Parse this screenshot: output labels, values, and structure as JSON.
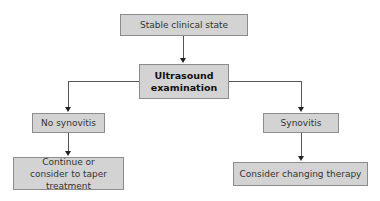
{
  "diagram": {
    "type": "flowchart",
    "nodes": {
      "start": "Stable clinical state",
      "exam": "Ultrasound examination",
      "no_synovitis": "No synovitis",
      "synovitis": "Synovitis",
      "continue": "Continue or consider to taper treatment",
      "change": "Consider changing therapy"
    },
    "edges": [
      {
        "from": "start",
        "to": "exam"
      },
      {
        "from": "exam",
        "to": "no_synovitis"
      },
      {
        "from": "exam",
        "to": "synovitis"
      },
      {
        "from": "no_synovitis",
        "to": "continue"
      },
      {
        "from": "synovitis",
        "to": "change"
      }
    ],
    "colors": {
      "box_fill": "#d3d3d3",
      "box_border": "#8c8c8c",
      "line": "#555555"
    }
  }
}
